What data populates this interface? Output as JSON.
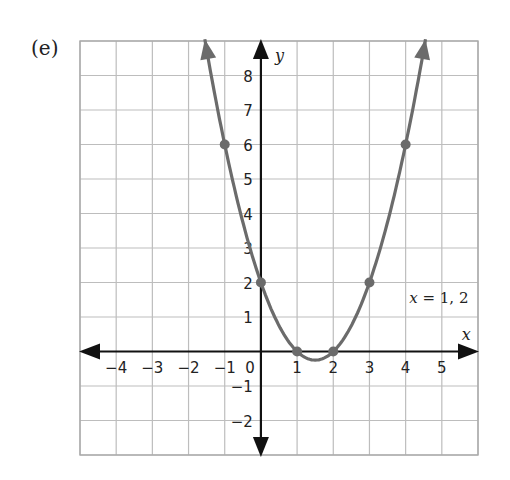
{
  "part_label": "(e)",
  "chart_data": {
    "type": "line",
    "title": "",
    "xlabel": "x",
    "ylabel": "y",
    "xlim": [
      -5,
      6
    ],
    "ylim": [
      -3,
      9
    ],
    "grid": true,
    "x_ticks": [
      -4,
      -3,
      -2,
      -1,
      0,
      1,
      2,
      3,
      4,
      5
    ],
    "y_ticks": [
      -2,
      -1,
      1,
      2,
      3,
      4,
      5,
      6,
      7,
      8
    ],
    "function": "y = x^2 - 3x + 2",
    "series": [
      {
        "name": "parabola",
        "color": "#6b6b6b",
        "points": [
          {
            "x": -1,
            "y": 6
          },
          {
            "x": 0,
            "y": 2
          },
          {
            "x": 1,
            "y": 0
          },
          {
            "x": 2,
            "y": 0
          },
          {
            "x": 3,
            "y": 2
          },
          {
            "x": 4,
            "y": 6
          }
        ]
      }
    ],
    "annotations": [
      {
        "text": "x = 1, 2",
        "x": 4.1,
        "y": 1.4
      }
    ]
  }
}
